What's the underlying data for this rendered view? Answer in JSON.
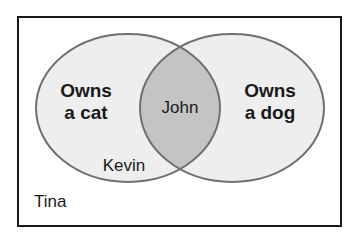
{
  "diagram": {
    "type": "venn",
    "universe": {
      "label": "Tina"
    },
    "sets": [
      {
        "id": "cat",
        "line1": "Owns",
        "line2": "a cat",
        "member_only": "Kevin"
      },
      {
        "id": "dog",
        "line1": "Owns",
        "line2": "a dog",
        "member_only": ""
      }
    ],
    "intersection": {
      "label": "John"
    },
    "colors": {
      "border": "#1a1a1a",
      "set_fill": "#eeeeee",
      "set_stroke": "#707070",
      "intersection_fill": "#c4c4c4",
      "background": "#ffffff"
    }
  }
}
